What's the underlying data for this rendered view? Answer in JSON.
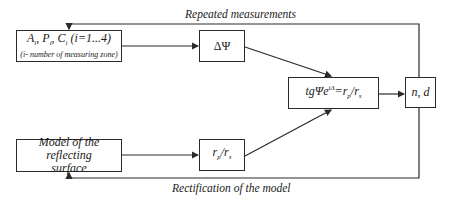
{
  "labels": {
    "top_feedback": "Repeated measurements",
    "bottom_feedback": "Rectification of the model"
  },
  "boxes": {
    "input": {
      "line1_A": "A",
      "line1_P": "P",
      "line1_C": "C",
      "sub_i": "i",
      "range": "(i=1...4)",
      "line2": "(i- number of measuring zone)"
    },
    "delta_psi": {
      "text": "ΔΨ"
    },
    "equation": {
      "prefix": "tgΨe",
      "sup": "iΔ",
      "eq": "=r",
      "sub_p": "p",
      "slash": "/r",
      "sub_s": "s"
    },
    "output": {
      "text": "n, d"
    },
    "model": {
      "line1": "Model of the reflecting",
      "line2": "surface"
    },
    "ratio": {
      "r1": "r",
      "sub_p": "p",
      "slash": "/r",
      "sub_s": "s"
    }
  }
}
